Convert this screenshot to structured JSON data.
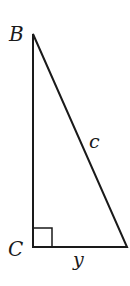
{
  "diagram": {
    "type": "right-triangle",
    "vertices": {
      "B": {
        "label": "B"
      },
      "C": {
        "label": "C"
      }
    },
    "sides": {
      "hypotenuse": {
        "label": "c"
      },
      "bottom": {
        "label": "y"
      }
    },
    "right_angle_at": "C",
    "colors": {
      "stroke": "#1a1a1a",
      "background": "#ffffff"
    }
  }
}
